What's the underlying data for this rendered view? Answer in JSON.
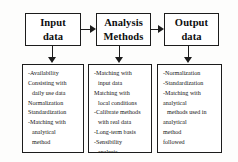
{
  "diagram": {
    "colors": {
      "stroke": "#1c1c1c",
      "box_fill": "#ffffff",
      "background": "#fdfdfc",
      "text": "#0d0d0d"
    },
    "stages": [
      {
        "id": "input",
        "title_line1": "Input",
        "title_line2": "data",
        "details": [
          "-Availability",
          "Consisting with",
          "daily use data",
          "Normalization",
          "Standardization",
          "-Matching with",
          "analytical",
          "method"
        ]
      },
      {
        "id": "methods",
        "title_line1": "Analysis",
        "title_line2": "Methods",
        "details": [
          "-Matching with",
          "input data",
          "Matching with",
          "local conditions",
          "-Calibrate methods",
          "with real data",
          "-Long-term basis",
          "-Sensibility",
          "analysis"
        ]
      },
      {
        "id": "output",
        "title_line1": "Output",
        "title_line2": "data",
        "details": [
          "-Normalization",
          "-Standardization",
          "-Matching with",
          "analytical",
          "methods used in",
          "analytical",
          "method",
          "followed"
        ]
      }
    ],
    "connectors": [
      {
        "id": "input-to-methods",
        "kind": "horizontal-arrow"
      },
      {
        "id": "methods-to-output",
        "kind": "horizontal-arrow"
      },
      {
        "id": "input-to-details",
        "kind": "vertical-arrow"
      },
      {
        "id": "methods-to-details",
        "kind": "vertical-arrow"
      },
      {
        "id": "output-to-details",
        "kind": "vertical-arrow"
      }
    ]
  }
}
